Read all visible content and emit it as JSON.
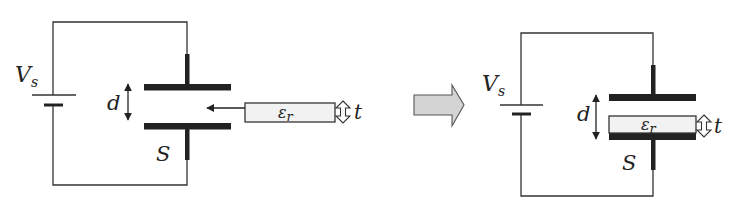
{
  "figure": {
    "colors": {
      "wire": "#333333",
      "plate": "#222222",
      "dielectric_fill": "#f2f2f2",
      "transition_arrow_fill": "#d4d4d4",
      "transition_arrow_stroke": "#555555"
    }
  },
  "before": {
    "source_label": "V",
    "source_subscript": "s",
    "gap_label": "d",
    "area_label": "S",
    "dielectric_label": "ε",
    "dielectric_subscript": "r",
    "thickness_label": "t"
  },
  "transition": {
    "arrow_icon": "block-arrow-right"
  },
  "after": {
    "source_label": "V",
    "source_subscript": "s",
    "gap_label": "d",
    "area_label": "S",
    "dielectric_label": "ε",
    "dielectric_subscript": "r",
    "thickness_label": "t"
  }
}
